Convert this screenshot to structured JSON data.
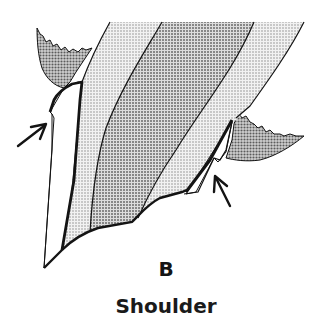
{
  "figure": {
    "panel_letter": "B",
    "caption": "Shoulder",
    "colors": {
      "outline": "#141414",
      "enamel_light_fill": "#d9d9d9",
      "dentin_dark_fill": "#b8b8b8",
      "gingiva_fill": "#a9a9a9",
      "restoration_gap": "#ffffff",
      "background": "#ffffff"
    },
    "arrows": [
      {
        "name": "left-shoulder-arrow",
        "points_to": "left shoulder margin"
      },
      {
        "name": "right-shoulder-arrow",
        "points_to": "right shoulder margin"
      }
    ]
  }
}
